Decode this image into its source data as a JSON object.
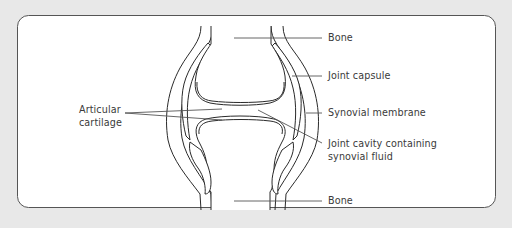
{
  "diagram": {
    "type": "anatomy",
    "colors": {
      "background": "#e8e8e8",
      "panel": "#ffffff",
      "panel_border": "#555555",
      "line": "#2a2a2a",
      "leader_line": "#555555",
      "text": "#3a3a3a"
    },
    "labels": {
      "bone_top": "Bone",
      "joint_capsule": "Joint capsule",
      "synovial_membrane": "Synovial membrane",
      "joint_cavity_line1": "Joint cavity containing",
      "joint_cavity_line2": "synovial fluid",
      "bone_bottom": "Bone",
      "articular_line1": "Articular",
      "articular_line2": "cartilage"
    }
  }
}
